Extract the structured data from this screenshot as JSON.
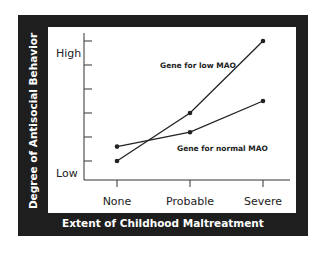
{
  "chart_data": {
    "type": "line",
    "title": "",
    "xlabel": "Extent of Childhood Maltreatment",
    "ylabel": "Degree of Antisocial Behavior",
    "categories": [
      "None",
      "Probable",
      "Severe"
    ],
    "y_tick_labels": {
      "high": "High",
      "low": "Low"
    },
    "ylim": [
      0,
      6
    ],
    "y_ticks": [
      1,
      2,
      3,
      4,
      5,
      6
    ],
    "grid": false,
    "legend_position": "inline labels",
    "series": [
      {
        "name": "Gene for low MAO",
        "values": [
          1.0,
          3.0,
          6.0
        ]
      },
      {
        "name": "Gene for normal MAO",
        "values": [
          1.6,
          2.2,
          3.5
        ]
      }
    ]
  },
  "labels": {
    "ylabel": "Degree of Antisocial Behavior",
    "xlabel": "Extent of Childhood Maltreatment",
    "high": "High",
    "low": "Low",
    "x0": "None",
    "x1": "Probable",
    "x2": "Severe",
    "series_low": "Gene for low MAO",
    "series_normal": "Gene for normal MAO"
  },
  "colors": {
    "frame": "#1e1e1e",
    "panel": "#ffffff",
    "line": "#222222"
  }
}
